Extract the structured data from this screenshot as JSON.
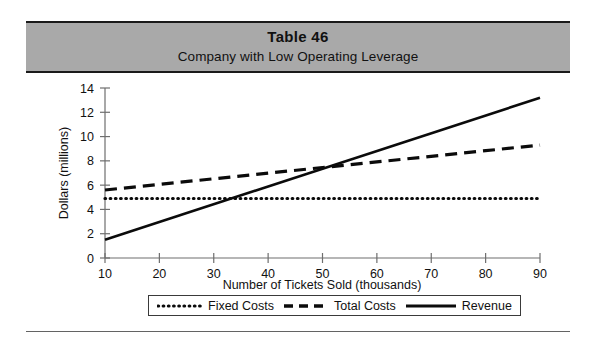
{
  "banner": {
    "title": "Table 46",
    "subtitle": "Company with Low Operating Leverage",
    "background_color": "#a9a9a9"
  },
  "legend": {
    "items": [
      {
        "label": "Fixed Costs",
        "style": "dotted",
        "icon": "dotted-line-swatch-icon"
      },
      {
        "label": "Total Costs",
        "style": "dashed",
        "icon": "dashed-line-swatch-icon"
      },
      {
        "label": "Revenue",
        "style": "solid",
        "icon": "solid-line-swatch-icon"
      }
    ]
  },
  "chart_data": {
    "type": "line",
    "title": "Table 46",
    "subtitle": "Company with Low Operating Leverage",
    "xlabel": "Number of Tickets Sold (thousands)",
    "ylabel": "Dollars (millions)",
    "xlim": [
      10,
      90
    ],
    "ylim": [
      0,
      14
    ],
    "xticks": [
      10,
      20,
      30,
      40,
      50,
      60,
      70,
      80,
      90
    ],
    "yticks": [
      0,
      2,
      4,
      6,
      8,
      10,
      12,
      14
    ],
    "xtick_labels": [
      "10",
      "20",
      "30",
      "40",
      "50",
      "60",
      "70",
      "80",
      "90"
    ],
    "ytick_labels": [
      "0",
      "2",
      "4",
      "6",
      "8",
      "10",
      "12",
      "14"
    ],
    "grid": false,
    "legend_position": "bottom-center",
    "x": [
      10,
      90
    ],
    "series": [
      {
        "name": "Fixed Costs",
        "style": "dotted",
        "color": "#0b0b0b",
        "values": [
          4.9,
          4.9
        ]
      },
      {
        "name": "Total Costs",
        "style": "dashed",
        "color": "#0b0b0b",
        "values": [
          5.6,
          9.3
        ]
      },
      {
        "name": "Revenue",
        "style": "solid",
        "color": "#0b0b0b",
        "values": [
          1.5,
          13.2
        ]
      }
    ],
    "annotations": [
      "Revenue crosses Fixed Costs near 35 thousand tickets",
      "Revenue crosses Total Costs (break-even) near 50 thousand tickets"
    ]
  }
}
